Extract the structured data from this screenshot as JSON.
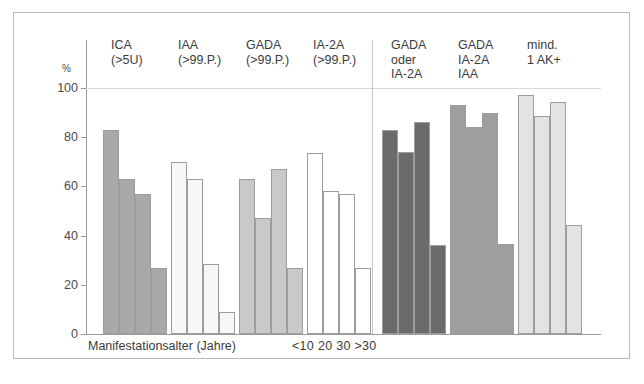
{
  "figure": {
    "y_unit": "%",
    "x_caption": "Manifestationsalter (Jahre)",
    "age_legend": "<10 20 30 >30",
    "tick_labels": [
      "0",
      "20",
      "40",
      "60",
      "80",
      "100"
    ]
  },
  "colors": {
    "frame": "#b9b9b9",
    "axis": "#9a9a9a",
    "gridline": "#d8d8d8",
    "divider": "#c6c6c6",
    "bar_outline": "#9d9d9d",
    "text": "#3c3c3c",
    "series_medium_gray": "#a9a9a9",
    "series_near_white": "#f7f7f7",
    "series_light_gray": "#c9c9c9",
    "series_white": "#ffffff",
    "series_dark_gray": "#6b6b6b",
    "series_mid_gray": "#9e9e9e",
    "series_pale_gray": "#e3e3e3"
  },
  "chart_data": {
    "type": "bar",
    "title": "",
    "xlabel": "Manifestationsalter (Jahre)",
    "ylabel": "%",
    "ylim": [
      0,
      100
    ],
    "yticks": [
      0,
      20,
      40,
      60,
      80,
      100
    ],
    "grid": "single gridline at 100",
    "legend": "position: below IA-2A group, age categories",
    "categories": [
      "<10",
      "20",
      "30",
      ">30"
    ],
    "groups": [
      {
        "label": "ICA\n(>5U)",
        "label_line1": "ICA",
        "label_line2": "(>5U)",
        "fill": "#a9a9a9",
        "values": [
          83,
          63,
          57,
          27
        ]
      },
      {
        "label": "IAA\n(>99.P.)",
        "label_line1": "IAA",
        "label_line2": "(>99.P.)",
        "fill": "#f7f7f7",
        "values": [
          70,
          63,
          28.5,
          9
        ]
      },
      {
        "label": "GADA\n(>99.P.)",
        "label_line1": "GADA",
        "label_line2": "(>99.P.)",
        "fill": "#c9c9c9",
        "values": [
          63,
          47,
          67,
          27
        ]
      },
      {
        "label": "IA-2A\n(>99.P.)",
        "label_line1": "IA-2A",
        "label_line2": "(>99.P.)",
        "fill": "#ffffff",
        "values": [
          73.5,
          58,
          57,
          27
        ]
      },
      {
        "label": "GADA\noder\nIA-2A",
        "label_line1": "GADA",
        "label_line2": "oder",
        "label_line3": "IA-2A",
        "fill": "#6b6b6b",
        "values": [
          83,
          74,
          86,
          36
        ]
      },
      {
        "label": "GADA\nIA-2A\nIAA",
        "label_line1": "GADA",
        "label_line2": "IA-2A",
        "label_line3": "IAA",
        "fill": "#9e9e9e",
        "values": [
          93,
          84,
          90,
          36.5
        ]
      },
      {
        "label": "mind.\n1 AK+",
        "label_line1": "mind.",
        "label_line2": "1 AK+",
        "fill": "#e3e3e3",
        "values": [
          97,
          88.5,
          94.5,
          44.5
        ]
      }
    ]
  }
}
